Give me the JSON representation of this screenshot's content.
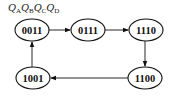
{
  "header": {
    "vars": [
      {
        "base": "Q",
        "sub": "A"
      },
      {
        "base": "Q",
        "sub": "B"
      },
      {
        "base": "Q",
        "sub": "C"
      },
      {
        "base": "Q",
        "sub": "D"
      }
    ]
  },
  "states": [
    {
      "id": "s0",
      "label": "0011",
      "cx": 32,
      "cy": 30
    },
    {
      "id": "s1",
      "label": "0111",
      "cx": 88,
      "cy": 30
    },
    {
      "id": "s2",
      "label": "1110",
      "cx": 146,
      "cy": 30
    },
    {
      "id": "s3",
      "label": "1100",
      "cx": 145,
      "cy": 78
    },
    {
      "id": "s4",
      "label": "1001",
      "cx": 33,
      "cy": 78
    }
  ],
  "transitions": [
    {
      "from": "0011",
      "to": "0111"
    },
    {
      "from": "0111",
      "to": "1110"
    },
    {
      "from": "1110",
      "to": "1100"
    },
    {
      "from": "1100",
      "to": "1001"
    },
    {
      "from": "1001",
      "to": "0011"
    }
  ],
  "colors": {
    "stroke": "#111111",
    "background": "#ffffff"
  }
}
